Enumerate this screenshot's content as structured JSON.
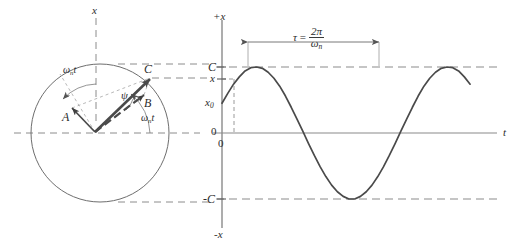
{
  "figure": {
    "background": "#ffffff",
    "ink_color": "#3a3a3a",
    "dash_color": "#8c8c8c"
  },
  "left_panel": {
    "name": "phasor-circle-diagram",
    "axis_label_vertical": "x",
    "circle": {
      "cx": 100,
      "cy": 133,
      "r": 69
    },
    "origin": {
      "x": 95,
      "y": 132
    },
    "vectors": [
      {
        "label": "A",
        "tip_x": 72,
        "tip_y": 108,
        "style": "solid-thin"
      },
      {
        "label": "B",
        "tip_x": 144,
        "tip_y": 95,
        "style": "solid-thin"
      },
      {
        "label": "C",
        "tip_x": 150,
        "tip_y": 78,
        "style": "solid-thick"
      }
    ],
    "angles": [
      {
        "label": "ω",
        "sub": "n",
        "suffix": "t",
        "position": "upper-left"
      },
      {
        "label": "ψ",
        "sub": "",
        "suffix": "",
        "position": "center"
      },
      {
        "label": "ω",
        "sub": "n",
        "suffix": "t",
        "position": "lower-right"
      }
    ],
    "labels": {
      "vector_a": "A",
      "vector_b": "B",
      "vector_c": "C",
      "psi": "ψ",
      "omega_upper": "ω",
      "omega_upper_sub": "n",
      "omega_upper_suffix": "t",
      "omega_lower": "ω",
      "omega_lower_sub": "n",
      "omega_lower_suffix": "t"
    }
  },
  "right_panel": {
    "name": "harmonic-wave-plot",
    "axis_labels": {
      "y_top": "+x",
      "y_bottom": "-x",
      "x_axis": "t",
      "origin": "0",
      "zero_tick": "0"
    },
    "y_ticks": [
      {
        "label": "C",
        "value": 1.0
      },
      {
        "label": "x",
        "value": 0.82
      },
      {
        "label": "x",
        "sub": "0",
        "value": 0.45
      },
      {
        "label": "0",
        "value": 0.0
      },
      {
        "label": "-C",
        "value": -1.0
      }
    ],
    "period_annotation": {
      "tau": "τ",
      "equals": "=",
      "numerator": "2π",
      "denominator_symbol": "ω",
      "denominator_sub": "n"
    }
  },
  "chart_data": {
    "type": "line",
    "title": "",
    "xlabel": "t",
    "ylabel": "x",
    "xlim": [
      0,
      4.35
    ],
    "ylim": [
      -1.25,
      1.25
    ],
    "grid": false,
    "legend": null,
    "amplitude_C": 1.0,
    "initial_value_x0": 0.45,
    "phase_psi_rad": 0.4665,
    "period_tau": 2.0,
    "series": [
      {
        "name": "x = C sin(ωnt + ψ)",
        "x": [
          0.0,
          0.1,
          0.2,
          0.3,
          0.4,
          0.5,
          0.6,
          0.7,
          0.8,
          0.9,
          1.0,
          1.1,
          1.2,
          1.3,
          1.4,
          1.5,
          1.6,
          1.7,
          1.8,
          1.9,
          2.0,
          2.1,
          2.2,
          2.3,
          2.4,
          2.5,
          2.6,
          2.7,
          2.8,
          2.9,
          3.0,
          3.1,
          3.2,
          3.3,
          3.4,
          3.5,
          3.6,
          3.7,
          3.8,
          3.9,
          4.0,
          4.1,
          4.2,
          4.3
        ],
        "y": [
          0.45,
          0.6,
          0.74,
          0.85,
          0.94,
          0.99,
          1.0,
          0.98,
          0.92,
          0.83,
          0.71,
          0.56,
          0.39,
          0.21,
          0.03,
          -0.16,
          -0.34,
          -0.51,
          -0.66,
          -0.79,
          -0.89,
          -0.96,
          -1.0,
          -1.0,
          -0.96,
          -0.89,
          -0.79,
          -0.66,
          -0.51,
          -0.34,
          -0.16,
          0.03,
          0.21,
          0.39,
          0.56,
          0.71,
          0.83,
          0.92,
          0.98,
          1.0,
          0.99,
          0.94,
          0.85,
          0.74
        ]
      }
    ],
    "annotations": [
      {
        "text": "τ = 2π/ωn",
        "x_start": 0.38,
        "x_end": 2.38,
        "y": 1.18
      },
      {
        "text": "C",
        "y": 1.0,
        "type": "dashed-level"
      },
      {
        "text": "-C",
        "y": -1.0,
        "type": "dashed-level"
      },
      {
        "text": "x",
        "y": 0.82,
        "type": "dashed-marker"
      }
    ]
  }
}
